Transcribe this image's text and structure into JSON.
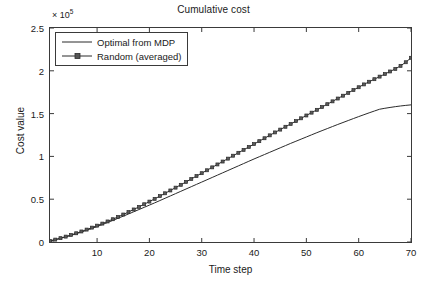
{
  "chart_data": {
    "type": "line",
    "title": "Cumulative cost",
    "xlabel": "Time step",
    "ylabel": "Cost value",
    "y_multiplier_text": "× 10",
    "y_multiplier_exponent": "5",
    "xlim": [
      1,
      70
    ],
    "ylim": [
      0,
      2.5
    ],
    "xticks": [
      10,
      20,
      30,
      40,
      50,
      60,
      70
    ],
    "xtick_labels": [
      "10",
      "20",
      "30",
      "40",
      "50",
      "60",
      "70"
    ],
    "yticks": [
      0,
      0.5,
      1,
      1.5,
      2,
      2.5
    ],
    "ytick_labels": [
      "0",
      "0.5",
      "1",
      "1.5",
      "2",
      "2.5"
    ],
    "grid": false,
    "legend_position": "upper left",
    "background_color": "#ffffff",
    "axis_color": "#3a3a3a",
    "series": [
      {
        "name": "Optimal from MDP",
        "color": "#2b2b2b",
        "marker": "none",
        "line_width": 1,
        "x": [
          1,
          2,
          3,
          4,
          5,
          6,
          7,
          8,
          9,
          10,
          11,
          12,
          13,
          14,
          15,
          16,
          17,
          18,
          19,
          20,
          21,
          22,
          23,
          24,
          25,
          26,
          27,
          28,
          29,
          30,
          31,
          32,
          33,
          34,
          35,
          36,
          37,
          38,
          39,
          40,
          41,
          42,
          43,
          44,
          45,
          46,
          47,
          48,
          49,
          50,
          51,
          52,
          53,
          54,
          55,
          56,
          57,
          58,
          59,
          60,
          61,
          62,
          63,
          64,
          65,
          66,
          67,
          68,
          69,
          70
        ],
        "values": [
          0.012,
          0.026,
          0.042,
          0.059,
          0.077,
          0.096,
          0.116,
          0.137,
          0.159,
          0.181,
          0.204,
          0.228,
          0.252,
          0.277,
          0.302,
          0.327,
          0.353,
          0.379,
          0.405,
          0.431,
          0.457,
          0.484,
          0.511,
          0.538,
          0.565,
          0.592,
          0.619,
          0.646,
          0.673,
          0.7,
          0.727,
          0.754,
          0.781,
          0.808,
          0.835,
          0.862,
          0.889,
          0.916,
          0.943,
          0.97,
          0.996,
          1.022,
          1.048,
          1.074,
          1.1,
          1.126,
          1.152,
          1.177,
          1.202,
          1.227,
          1.252,
          1.277,
          1.301,
          1.325,
          1.349,
          1.373,
          1.396,
          1.419,
          1.442,
          1.465,
          1.487,
          1.509,
          1.53,
          1.551,
          1.562,
          1.572,
          1.581,
          1.589,
          1.596,
          1.602
        ]
      },
      {
        "name": "Random (averaged)",
        "color": "#2b2b2b",
        "marker": "square",
        "marker_size": 3,
        "line_width": 1,
        "x": [
          1,
          2,
          3,
          4,
          5,
          6,
          7,
          8,
          9,
          10,
          11,
          12,
          13,
          14,
          15,
          16,
          17,
          18,
          19,
          20,
          21,
          22,
          23,
          24,
          25,
          26,
          27,
          28,
          29,
          30,
          31,
          32,
          33,
          34,
          35,
          36,
          37,
          38,
          39,
          40,
          41,
          42,
          43,
          44,
          45,
          46,
          47,
          48,
          49,
          50,
          51,
          52,
          53,
          54,
          55,
          56,
          57,
          58,
          59,
          60,
          61,
          62,
          63,
          64,
          65,
          66,
          67,
          68,
          69,
          70
        ],
        "values": [
          0.013,
          0.028,
          0.045,
          0.063,
          0.082,
          0.102,
          0.123,
          0.145,
          0.168,
          0.191,
          0.215,
          0.24,
          0.266,
          0.293,
          0.321,
          0.35,
          0.38,
          0.41,
          0.441,
          0.472,
          0.504,
          0.536,
          0.569,
          0.602,
          0.635,
          0.668,
          0.702,
          0.736,
          0.77,
          0.804,
          0.838,
          0.872,
          0.906,
          0.94,
          0.974,
          1.008,
          1.042,
          1.076,
          1.11,
          1.144,
          1.178,
          1.212,
          1.246,
          1.28,
          1.313,
          1.346,
          1.379,
          1.412,
          1.445,
          1.478,
          1.511,
          1.544,
          1.577,
          1.61,
          1.643,
          1.676,
          1.709,
          1.742,
          1.775,
          1.808,
          1.841,
          1.872,
          1.902,
          1.932,
          1.962,
          1.992,
          2.022,
          2.058,
          2.1,
          2.152
        ]
      }
    ]
  }
}
